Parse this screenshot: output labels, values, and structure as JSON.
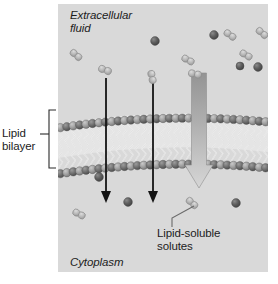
{
  "figure": {
    "panel": {
      "background_color": "#d9d9d9",
      "x": 58,
      "y": 4,
      "width": 210,
      "height": 268
    }
  },
  "labels": {
    "extracellular_fluid": "Extracellular\nfluid",
    "cytoplasm": "Cytoplasm",
    "lipid_bilayer": "Lipid\nbilayer",
    "lipid_soluble_solutes": "Lipid-soluble\nsolutes"
  },
  "colors": {
    "panel_background": "#d9d9d9",
    "text": "#1c1c1c",
    "membrane_head_dark": "#6e6e6e",
    "membrane_head_light": "#a8a8a8",
    "membrane_tail": "#f2f2f2",
    "membrane_core": "#f4f4f4",
    "solute_dark": "#5d5d5d",
    "solute_light": "#b9b9b9",
    "arrow_black": "#141414",
    "arrow_gray_top": "#9a9a9a",
    "arrow_gray_bottom": "#d2d2d2",
    "leader_line": "#6a6a6a"
  },
  "membrane": {
    "name": "lipid-bilayer",
    "description": "Phospholipid bilayer with two rows of spherical head groups and interleaved hydrophobic tails",
    "head_count_per_row": 34,
    "left_y": 128,
    "mid_y": 112,
    "right_y": 122,
    "thickness": 46
  },
  "bracket": {
    "name": "lipid-bilayer-bracket",
    "x": 49,
    "top": 110,
    "bottom": 168
  },
  "arrows": {
    "black": [
      {
        "name": "diffusion-arrow-left",
        "x": 106,
        "y1": 78,
        "y2": 201
      },
      {
        "name": "diffusion-arrow-middle",
        "x": 153,
        "y1": 78,
        "y2": 201
      }
    ],
    "gray": {
      "name": "bulk-diffusion-arrow",
      "x": 199,
      "y1": 73,
      "y2": 188,
      "shaft_width": 15,
      "head_width": 27
    }
  },
  "leader_lines": [
    {
      "name": "solutes-leader-line",
      "points": "194,206 172,218 172,226"
    }
  ],
  "solutes": {
    "dark_single": [
      {
        "cx": 155,
        "cy": 41,
        "r": 4.4
      },
      {
        "cx": 214,
        "cy": 35,
        "r": 4.4
      },
      {
        "cx": 258,
        "cy": 67,
        "r": 4.4
      },
      {
        "cx": 240,
        "cy": 66,
        "r": 4.0
      },
      {
        "cx": 99,
        "cy": 177,
        "r": 4.4
      },
      {
        "cx": 128,
        "cy": 202,
        "r": 4.4
      },
      {
        "cx": 236,
        "cy": 203,
        "r": 4.4
      }
    ],
    "light_pairs": [
      {
        "x": 76,
        "y": 55,
        "angle": 40
      },
      {
        "x": 105,
        "y": 70,
        "angle": 20
      },
      {
        "x": 152,
        "y": 77,
        "angle": 78
      },
      {
        "x": 188,
        "y": 60,
        "angle": 28
      },
      {
        "x": 195,
        "y": 74,
        "angle": 12
      },
      {
        "x": 230,
        "y": 35,
        "angle": 35
      },
      {
        "x": 246,
        "y": 55,
        "angle": 30
      },
      {
        "x": 262,
        "y": 33,
        "angle": 40
      },
      {
        "x": 79,
        "y": 214,
        "angle": 28
      },
      {
        "x": 192,
        "y": 203,
        "angle": 42
      }
    ]
  }
}
